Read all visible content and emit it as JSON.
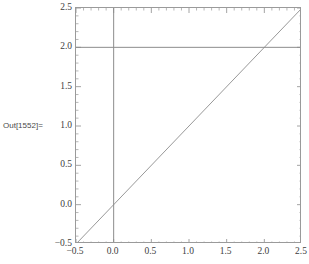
{
  "output_label": "Out[1552]=",
  "chart_data": {
    "type": "line",
    "title": "",
    "xlabel": "",
    "ylabel": "",
    "xlim": [
      -0.5,
      2.5
    ],
    "ylim": [
      -0.5,
      2.5
    ],
    "grid": false,
    "legend": null,
    "frame": true,
    "background": "#ffffff",
    "line_color": "#8c8c8c",
    "frame_color": "#9a9a9a",
    "tick_color": "#9a9a9a",
    "text_color": "#3d3d3d",
    "xticks": [
      -0.5,
      0.0,
      0.5,
      1.0,
      1.5,
      2.0,
      2.5
    ],
    "xtick_labels": [
      "-0.5",
      "0.0",
      "0.5",
      "1.0",
      "1.5",
      "2.0",
      "2.5"
    ],
    "yticks": [
      -0.5,
      0.0,
      0.5,
      1.0,
      1.5,
      2.0,
      2.5
    ],
    "ytick_labels": [
      "-0.5",
      "0.0",
      "0.5",
      "1.0",
      "1.5",
      "2.0",
      "2.5"
    ],
    "minor_tick_count": 4,
    "series": [
      {
        "name": "identity-line",
        "kind": "line",
        "x": [
          -0.5,
          2.5
        ],
        "y": [
          -0.5,
          2.5
        ]
      },
      {
        "name": "horizontal-line-y2",
        "kind": "hline",
        "y": 2.0,
        "x": [
          -0.5,
          2.5
        ]
      },
      {
        "name": "vertical-line-x0",
        "kind": "vline",
        "x": 0.0,
        "y": [
          -0.5,
          2.5
        ]
      }
    ],
    "intersections": [
      {
        "label": "y=x meets y=2",
        "x": 2.0,
        "y": 2.0
      },
      {
        "label": "y=x meets x=0",
        "x": 0.0,
        "y": 0.0
      }
    ]
  }
}
